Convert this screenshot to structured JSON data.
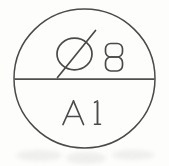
{
  "drawing": {
    "type": "engineering-drawing-symbol",
    "description": "Circular surface-finish / hole callout balloon divided by a horizontal diameter line",
    "background_color": "#fdfdfc",
    "ink_color": "#4a4a4a",
    "balloon": {
      "shape": "circle",
      "center_x": 84.5,
      "center_y": 78.5,
      "radius": 70,
      "stroke_width": 1.5
    },
    "divider": {
      "orientation": "horizontal",
      "y": 79,
      "x_start": 14,
      "x_end": 155,
      "stroke_width": 1.6
    },
    "upper_half": {
      "diameter_symbol": {
        "glyph": "Ø",
        "name": "diameter-sign",
        "circle_center_x": 74.5,
        "circle_center_y": 54,
        "circle_rx": 17.5,
        "circle_ry": 16,
        "slash_x1": 57.5,
        "slash_y1": 77,
        "slash_x2": 95,
        "slash_y2": 31
      },
      "value": "8"
    },
    "lower_half": {
      "letter": "A",
      "number": "1"
    }
  }
}
